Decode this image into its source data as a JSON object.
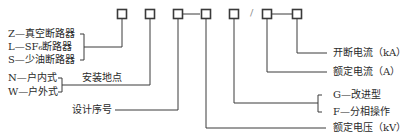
{
  "diagram": {
    "code_boxes": [
      "□",
      "□",
      "□",
      "□",
      "□",
      "□",
      "□"
    ],
    "separator_slash": "/",
    "left_labels": {
      "type_z": "Z—真空断路器",
      "type_l": "L—SF₆断路器",
      "type_s": "S—少油断路器",
      "indoor": "N—户内式",
      "outdoor": "W—户外式",
      "install_location": "安装地点",
      "design_number": "设计序号"
    },
    "right_labels": {
      "breaking_current": "开断电流（kA）",
      "rated_current": "额定电流（A）",
      "improved": "G—改进型",
      "phase_operation": "F—分相操作",
      "rated_voltage": "额定电压（kV）"
    },
    "colors": {
      "line": "#3a3a3a",
      "text": "#2a2a2a"
    }
  }
}
